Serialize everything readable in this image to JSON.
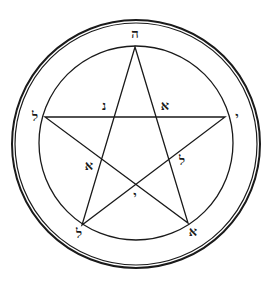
{
  "diagram": {
    "type": "pentagram-seal",
    "colors": {
      "ink": "#1a1a1a",
      "background": "#ffffff"
    },
    "outer_ring": {
      "cx": 136,
      "cy": 144,
      "r_outer": 124,
      "r_inner": 121
    },
    "inner_circle": {
      "cx": 136,
      "cy": 143,
      "r": 97
    },
    "star_vertices": [
      {
        "name": "top",
        "x": 135,
        "y": 47
      },
      {
        "name": "right",
        "x": 225,
        "y": 117
      },
      {
        "name": "bottom-right",
        "x": 188,
        "y": 223
      },
      {
        "name": "bottom-left",
        "x": 82,
        "y": 225
      },
      {
        "name": "left",
        "x": 45,
        "y": 117
      }
    ],
    "labels": [
      {
        "id": "top",
        "text": "ה",
        "x": 135,
        "y": 38
      },
      {
        "id": "left",
        "text": "ל",
        "x": 35,
        "y": 121
      },
      {
        "id": "right",
        "text": "י",
        "x": 237,
        "y": 121
      },
      {
        "id": "inner-left-upper",
        "text": "נ",
        "x": 104,
        "y": 110
      },
      {
        "id": "inner-right-upper",
        "text": "א",
        "x": 165,
        "y": 110
      },
      {
        "id": "inner-left-lower",
        "text": "א",
        "x": 89,
        "y": 170
      },
      {
        "id": "inner-right-lower",
        "text": "ל",
        "x": 182,
        "y": 165
      },
      {
        "id": "center-bottom",
        "text": "י",
        "x": 135,
        "y": 200
      },
      {
        "id": "bottom-left",
        "text": "ל",
        "x": 79,
        "y": 238
      },
      {
        "id": "bottom-right",
        "text": "א",
        "x": 193,
        "y": 236
      }
    ]
  }
}
